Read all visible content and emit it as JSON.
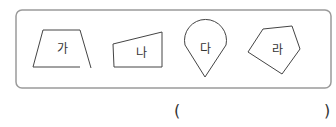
{
  "problem": {
    "shapes": [
      {
        "id": "ga",
        "label": "가",
        "kind": "open-quadrilateral"
      },
      {
        "id": "na",
        "label": "나",
        "kind": "quadrilateral"
      },
      {
        "id": "da",
        "label": "다",
        "kind": "teardrop-curved-figure"
      },
      {
        "id": "ra",
        "label": "라",
        "kind": "pentagon"
      }
    ],
    "answer": {
      "open_paren": "(",
      "close_paren": ")",
      "value": ""
    }
  },
  "colors": {
    "box_border": "#9a9a9a",
    "shape_stroke": "#444444",
    "text": "#333333"
  }
}
